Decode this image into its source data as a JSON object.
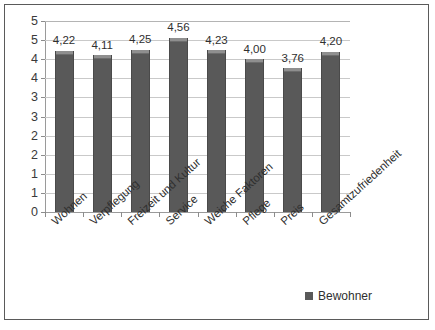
{
  "chart_data": {
    "type": "bar",
    "title": "",
    "subtitle": "",
    "xlabel": "",
    "ylabel": "",
    "ylim": [
      0,
      5
    ],
    "ytick_step": 0.5,
    "grid": true,
    "legend_position": "bottom-right",
    "categories": [
      "Wohnen",
      "Verpflegung",
      "Freizeit und Kultur",
      "Service",
      "Weiche Faktoren",
      "Pflege",
      "Preis",
      "Gesamtzufriedenheit"
    ],
    "values": [
      4.22,
      4.11,
      4.25,
      4.56,
      4.23,
      4.0,
      3.76,
      4.2
    ],
    "value_labels": [
      "4,22",
      "4,11",
      "4,25",
      "4,56",
      "4,23",
      "4,00",
      "3,76",
      "4,20"
    ],
    "ytick_labels": [
      "5",
      "5",
      "4",
      "4",
      "3",
      "3",
      "2",
      "2",
      "1",
      "1",
      "0"
    ],
    "ytick_values": [
      5.0,
      4.5,
      4.0,
      3.5,
      3.0,
      2.5,
      2.0,
      1.5,
      1.0,
      0.5,
      0.0
    ],
    "series": [
      {
        "name": "Bewohner",
        "color": "#595959",
        "values": [
          4.22,
          4.11,
          4.25,
          4.56,
          4.23,
          4.0,
          3.76,
          4.2
        ]
      }
    ]
  },
  "legend": {
    "entries": [
      {
        "label": "Bewohner",
        "color": "#595959"
      }
    ]
  },
  "colors": {
    "bar_fill": "#595959",
    "bar_cap": "#8f8f8f",
    "gridline": "#c9c9c9",
    "axis": "#9a9a9a",
    "frame_border": "#5a5a5a",
    "text": "#2f2f2f",
    "background": "#ffffff"
  }
}
